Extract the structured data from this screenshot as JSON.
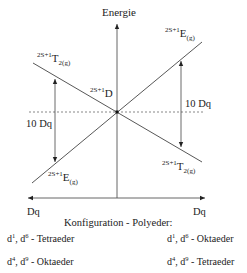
{
  "diagram": {
    "title_axis": "Energie",
    "center_term": {
      "prefix": "2S+1",
      "symbol": "D"
    },
    "terms": {
      "upper_left": {
        "prefix": "2S+1",
        "symbol": "T",
        "subscript": "2(g)"
      },
      "upper_right": {
        "prefix": "2S+1",
        "symbol": "E",
        "subscript": "(g)"
      },
      "lower_left": {
        "prefix": "2S+1",
        "symbol": "E",
        "subscript": "(g)"
      },
      "lower_right": {
        "prefix": "2S+1",
        "symbol": "T",
        "subscript": "2(g)"
      }
    },
    "splitting_left": "10 Dq",
    "splitting_right": "10 Dq",
    "axis_left_label": "Dq",
    "axis_right_label": "Dq",
    "caption": "Konfiguration - Polyeder:",
    "left_configs": [
      {
        "d_a": "d",
        "sup_a": "1",
        "d_b": "d",
        "sup_b": "6",
        "polyhedron": "- Tetraeder"
      },
      {
        "d_a": "d",
        "sup_a": "4",
        "d_b": "d",
        "sup_b": "9",
        "polyhedron": "- Oktaeder"
      }
    ],
    "right_configs": [
      {
        "d_a": "d",
        "sup_a": "1",
        "d_b": "d",
        "sup_b": "6",
        "polyhedron": "- Oktaeder"
      },
      {
        "d_a": "d",
        "sup_a": "4",
        "d_b": "d",
        "sup_b": "9",
        "polyhedron": "- Tetraeder"
      }
    ]
  }
}
